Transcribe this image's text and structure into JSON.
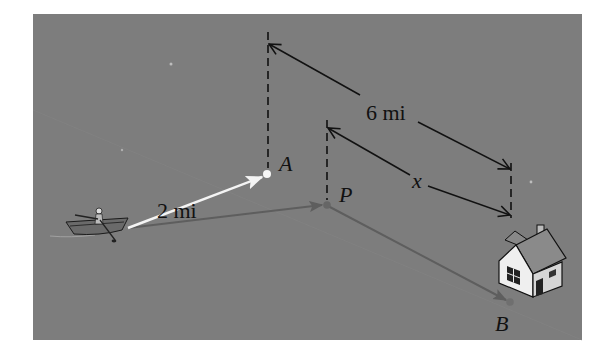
{
  "figure": {
    "panel_color": "#7d7d7d",
    "labels": {
      "point_a": "A",
      "point_p": "P",
      "point_b": "B",
      "dist_boat_to_a": "2 mi",
      "dist_a_to_b": "6 mi",
      "dist_p_to_b": "x"
    },
    "colors": {
      "boat_to_a_arrow": "#f4f4f4",
      "boat_to_p_arrow": "#5e5e5e",
      "p_to_b_arrow": "#5e5e5e",
      "dimension_lines": "#111111",
      "point_a": "#f6f6f6",
      "point_p": "#666666",
      "point_b": "#6f6f6f"
    }
  }
}
